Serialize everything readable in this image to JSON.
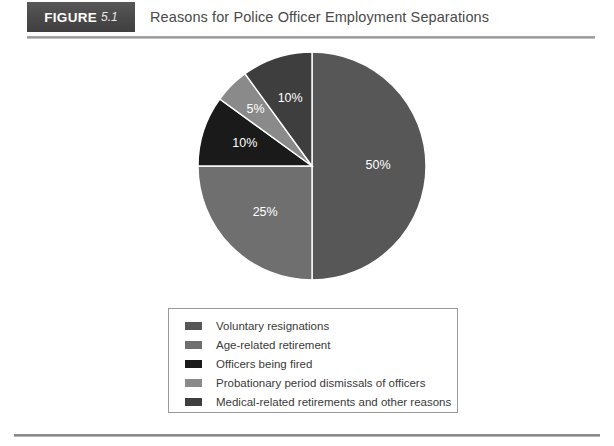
{
  "header": {
    "figure_word": "FIGURE",
    "figure_number": "5.1",
    "title": "Reasons for Police Officer Employment Separations",
    "tab_color": "#4b4b4b",
    "title_color": "#4a4a4a",
    "rule_color": "#8e8e8e"
  },
  "chart_data": {
    "type": "pie",
    "title": "Reasons for Police Officer Employment Separations",
    "categories": [
      "Voluntary resignations",
      "Age-related retirement",
      "Officers being fired",
      "Probationary period dismissals of officers",
      "Medical-related retirements and other reasons"
    ],
    "values": [
      50,
      25,
      10,
      5,
      10
    ],
    "labels": [
      "50%",
      "25%",
      "10%",
      "5%",
      "10%"
    ],
    "colors": [
      "#575757",
      "#6f6f6f",
      "#1a1a1a",
      "#8a8a8a",
      "#3e3e3e"
    ],
    "label_color": "#ffffff",
    "legend_position": "bottom",
    "grid": false,
    "start_angle_deg": 0,
    "direction": "clockwise"
  },
  "legend": {
    "items": [
      {
        "label": "Voluntary resignations",
        "color": "#575757"
      },
      {
        "label": "Age-related retirement",
        "color": "#6f6f6f"
      },
      {
        "label": "Officers being fired",
        "color": "#1a1a1a"
      },
      {
        "label": "Probationary period dismissals of officers",
        "color": "#8a8a8a"
      },
      {
        "label": "Medical-related retirements and other reasons",
        "color": "#3e3e3e"
      }
    ],
    "border_color": "#9a9a9a"
  },
  "footer": {
    "rule_color": "#7d7d7d"
  }
}
